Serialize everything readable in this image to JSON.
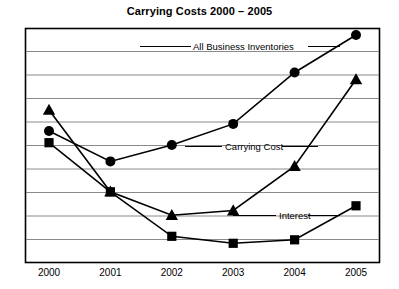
{
  "chart_data": {
    "type": "line",
    "title": "Carrying Costs 2000 – 2005",
    "xlabel": "",
    "ylabel": "",
    "categories": [
      "2000",
      "2001",
      "2002",
      "2003",
      "2004",
      "2005"
    ],
    "x": [
      2000,
      2001,
      2002,
      2003,
      2004,
      2005
    ],
    "ylim": [
      0,
      10
    ],
    "yticks": [
      0,
      1,
      2,
      3,
      4,
      5,
      6,
      7,
      8,
      9,
      10
    ],
    "grid": "horizontal",
    "y_axis_labeled": false,
    "legend": "inline-labels",
    "series": [
      {
        "name": "All Business Inventories",
        "marker": "circle",
        "color": "#000000",
        "values": [
          5.6,
          4.3,
          5.0,
          5.9,
          8.1,
          9.7
        ]
      },
      {
        "name": "Carrying Cost",
        "marker": "triangle",
        "color": "#000000",
        "values": [
          6.5,
          3.0,
          2.0,
          2.2,
          4.1,
          7.8
        ]
      },
      {
        "name": "Interest",
        "marker": "square",
        "color": "#000000",
        "values": [
          5.1,
          3.0,
          1.1,
          0.8,
          0.95,
          2.4
        ]
      }
    ],
    "annotations": [
      {
        "text": "All Business Inventories",
        "for": "All Business Inventories"
      },
      {
        "text": "Carrying Cost",
        "for": "All Business Inventories"
      },
      {
        "text": "Interest",
        "for": "Interest"
      }
    ]
  }
}
